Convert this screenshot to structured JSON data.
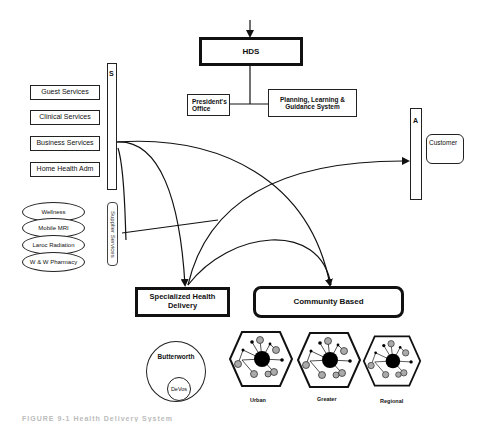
{
  "diagram": {
    "top": {
      "hds": "HDS",
      "presidents_office": "President's Office",
      "planning": "Planning, Learning & Guidance System"
    },
    "support_bar_label": "S",
    "services": [
      "Guest Services",
      "Clinical Services",
      "Business Services",
      "Home Health Adm"
    ],
    "supplier_ovals": [
      "Wellness",
      "Mobile MRI",
      "Laroc Radiation",
      "W & W Pharmacy"
    ],
    "supplier_services_label": "Supplier Services",
    "access_bar_label": "A",
    "customer": "Customer",
    "delivery": {
      "specialized": "Specialized Health Delivery",
      "community": "Community Based"
    },
    "specialized_nodes": {
      "outer": "Butterworth",
      "inner": "DeVos"
    },
    "community_nodes": [
      "Urban",
      "Greater",
      "Regional"
    ],
    "caption": "FIGURE 9-1  Health Delivery System"
  }
}
